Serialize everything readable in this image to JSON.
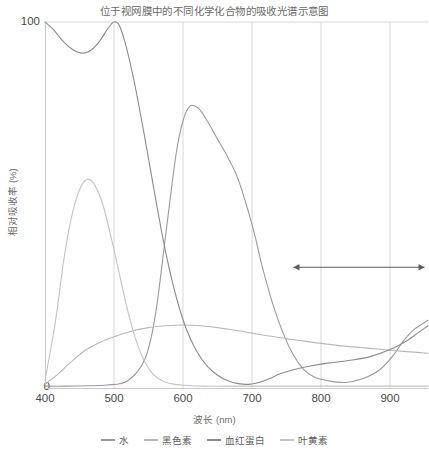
{
  "chart_data": {
    "type": "line",
    "title": "位于视网膜中的不同化学化合物的吸收光谱示意图",
    "xlabel": "波长 (nm)",
    "ylabel": "相对吸收率 (%)",
    "xlim": [
      400,
      955
    ],
    "ylim": [
      0,
      100
    ],
    "xticks": [
      400,
      500,
      600,
      700,
      800,
      900
    ],
    "yticks": [
      0,
      100
    ],
    "grid": "vertical",
    "legend_position": "bottom",
    "series": [
      {
        "name": "水",
        "color": "#9a9a9a",
        "points": [
          [
            400,
            0.5
          ],
          [
            430,
            0.5
          ],
          [
            460,
            0.6
          ],
          [
            490,
            0.8
          ],
          [
            520,
            2.0
          ],
          [
            545,
            8.0
          ],
          [
            560,
            20.0
          ],
          [
            575,
            42.0
          ],
          [
            590,
            64.0
          ],
          [
            600,
            73.0
          ],
          [
            610,
            77.0
          ],
          [
            622,
            76.5
          ],
          [
            635,
            73.0
          ],
          [
            650,
            68.0
          ],
          [
            665,
            63.0
          ],
          [
            680,
            57.0
          ],
          [
            695,
            48.0
          ],
          [
            705,
            41.0
          ],
          [
            715,
            33.0
          ],
          [
            730,
            23.0
          ],
          [
            745,
            15.0
          ],
          [
            760,
            9.0
          ],
          [
            775,
            5.0
          ],
          [
            790,
            3.0
          ],
          [
            810,
            2.0
          ],
          [
            835,
            1.5
          ],
          [
            860,
            2.5
          ],
          [
            885,
            5.0
          ],
          [
            905,
            9.0
          ],
          [
            920,
            13.0
          ],
          [
            935,
            16.0
          ],
          [
            955,
            18.5
          ]
        ]
      },
      {
        "name": "黑色素",
        "color": "#b8b8b8",
        "points": [
          [
            400,
            1.0
          ],
          [
            420,
            4.0
          ],
          [
            440,
            7.5
          ],
          [
            460,
            10.5
          ],
          [
            480,
            12.5
          ],
          [
            500,
            14.0
          ],
          [
            525,
            15.5
          ],
          [
            550,
            16.5
          ],
          [
            575,
            17.0
          ],
          [
            600,
            17.2
          ],
          [
            625,
            17.0
          ],
          [
            650,
            16.5
          ],
          [
            675,
            15.8
          ],
          [
            700,
            15.0
          ],
          [
            725,
            14.2
          ],
          [
            750,
            13.5
          ],
          [
            775,
            12.8
          ],
          [
            800,
            12.2
          ],
          [
            830,
            11.5
          ],
          [
            860,
            11.0
          ],
          [
            890,
            10.5
          ],
          [
            920,
            10.0
          ],
          [
            955,
            9.5
          ]
        ]
      },
      {
        "name": "血红蛋白",
        "color": "#8c8c8c",
        "points": [
          [
            400,
            100.0
          ],
          [
            412,
            98.0
          ],
          [
            425,
            95.0
          ],
          [
            440,
            92.5
          ],
          [
            455,
            91.5
          ],
          [
            468,
            92.5
          ],
          [
            480,
            95.0
          ],
          [
            492,
            98.5
          ],
          [
            500,
            100.0
          ],
          [
            508,
            99.0
          ],
          [
            518,
            93.0
          ],
          [
            530,
            83.0
          ],
          [
            545,
            68.0
          ],
          [
            560,
            52.0
          ],
          [
            575,
            37.0
          ],
          [
            590,
            25.0
          ],
          [
            605,
            16.0
          ],
          [
            620,
            10.0
          ],
          [
            635,
            6.0
          ],
          [
            650,
            3.5
          ],
          [
            665,
            2.0
          ],
          [
            680,
            1.2
          ],
          [
            695,
            1.0
          ],
          [
            710,
            1.5
          ],
          [
            725,
            2.5
          ],
          [
            740,
            3.8
          ],
          [
            760,
            5.0
          ],
          [
            785,
            6.0
          ],
          [
            810,
            6.8
          ],
          [
            840,
            7.5
          ],
          [
            870,
            8.5
          ],
          [
            900,
            10.5
          ],
          [
            925,
            13.0
          ],
          [
            940,
            15.0
          ],
          [
            955,
            17.0
          ]
        ]
      },
      {
        "name": "叶黄素",
        "color": "#c4c4c4",
        "points": [
          [
            400,
            2.0
          ],
          [
            415,
            18.0
          ],
          [
            428,
            36.0
          ],
          [
            440,
            48.0
          ],
          [
            452,
            55.0
          ],
          [
            462,
            57.0
          ],
          [
            472,
            55.5
          ],
          [
            484,
            50.0
          ],
          [
            496,
            41.0
          ],
          [
            508,
            31.0
          ],
          [
            520,
            21.0
          ],
          [
            532,
            13.0
          ],
          [
            545,
            7.0
          ],
          [
            558,
            3.5
          ],
          [
            572,
            1.8
          ],
          [
            588,
            1.0
          ],
          [
            605,
            0.7
          ],
          [
            630,
            0.5
          ],
          [
            660,
            0.5
          ],
          [
            700,
            0.5
          ],
          [
            750,
            0.5
          ],
          [
            800,
            0.5
          ],
          [
            860,
            0.5
          ],
          [
            955,
            0.5
          ]
        ]
      }
    ],
    "annotations": [
      {
        "type": "double-arrow",
        "x_start": 760,
        "x_end": 950,
        "y": 33
      }
    ]
  },
  "legend": {
    "items": [
      {
        "label": "水",
        "color": "#9a9a9a"
      },
      {
        "label": "黑色素",
        "color": "#b8b8b8"
      },
      {
        "label": "血红蛋白",
        "color": "#8c8c8c"
      },
      {
        "label": "叶黄素",
        "color": "#c4c4c4"
      }
    ]
  },
  "axes": {
    "x_tick_labels": [
      "400",
      "500",
      "600",
      "700",
      "800",
      "900"
    ],
    "y_tick_labels": {
      "max": "100",
      "min": "0"
    }
  },
  "colors": {
    "grid": "#d8d8d8",
    "axis": "#c9c9c9",
    "title_text": "#6a6a6a",
    "tick_text": "#4a4a4a",
    "annotation": "#5a5a5a"
  }
}
